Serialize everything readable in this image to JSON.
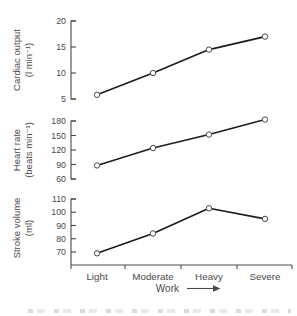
{
  "figure": {
    "x_axis": {
      "categories": [
        "Light",
        "Moderate",
        "Heavy",
        "Severe"
      ],
      "label": "Work"
    },
    "colors": {
      "ink": "#4a4a4a",
      "line": "#1c1c1c",
      "marker_fill": "#ffffff",
      "background": "#ffffff"
    }
  },
  "chart_data": [
    {
      "type": "line",
      "ylabel_line1": "Cardiac output",
      "ylabel_line2": "(l min⁻¹)",
      "yticks": [
        5,
        10,
        15,
        20
      ],
      "ylim": [
        5,
        20
      ],
      "categories": [
        "Light",
        "Moderate",
        "Heavy",
        "Severe"
      ],
      "values": [
        5.8,
        10,
        14.5,
        17
      ],
      "marker": "open-circle",
      "grid": false,
      "legend": false
    },
    {
      "type": "line",
      "ylabel_line1": "Heart rate",
      "ylabel_line2": "(beats min⁻¹)",
      "yticks": [
        60,
        90,
        120,
        150,
        180
      ],
      "ylim": [
        60,
        180
      ],
      "categories": [
        "Light",
        "Moderate",
        "Heavy",
        "Severe"
      ],
      "values": [
        88,
        124,
        152,
        183
      ],
      "marker": "open-circle",
      "grid": false,
      "legend": false
    },
    {
      "type": "line",
      "ylabel_line1": "Stroke volume",
      "ylabel_line2": "(ml)",
      "yticks": [
        70,
        80,
        90,
        100,
        110
      ],
      "ylim": [
        70,
        110
      ],
      "categories": [
        "Light",
        "Moderate",
        "Heavy",
        "Severe"
      ],
      "values": [
        69,
        84,
        103,
        95
      ],
      "xlabel": "Work",
      "marker": "open-circle",
      "grid": false,
      "legend": false
    }
  ]
}
